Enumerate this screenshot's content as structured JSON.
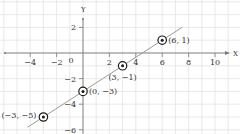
{
  "chart_data": {
    "type": "scatter",
    "title": "",
    "xlabel": "X",
    "ylabel": "Y",
    "xlim": [
      -6.3,
      11.8
    ],
    "ylim": [
      -6.4,
      4.1
    ],
    "grid": true,
    "x_ticks": [
      -4,
      -2,
      2,
      4,
      6,
      8,
      10
    ],
    "y_ticks": [
      2,
      -2,
      -4,
      -6
    ],
    "origin_label": "0",
    "points": [
      {
        "x": 6,
        "y": 1,
        "label": "(6, 1)"
      },
      {
        "x": 3,
        "y": -1,
        "label": "(3, −1)"
      },
      {
        "x": 0,
        "y": -3,
        "label": "(0, −3)"
      },
      {
        "x": -3,
        "y": -5,
        "label": "(−3, −5)"
      }
    ],
    "line": {
      "equation": "y = (2/3)x - 3",
      "x_start": -4.2,
      "x_end": 7.5
    },
    "colors": {
      "grid": "#e3e3e3",
      "axis": "#7a7a7a",
      "line": "#9a9a9a",
      "marker": "#1a1a1a",
      "text": "#333333"
    }
  }
}
